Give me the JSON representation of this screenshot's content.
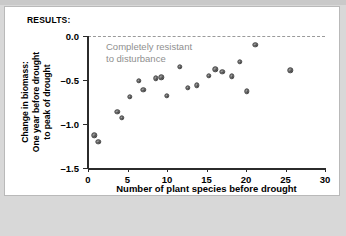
{
  "panel": {
    "header": "RESULTS:"
  },
  "chart_data": {
    "type": "scatter",
    "title": "",
    "xlabel": "Number of plant species before drought",
    "ylabel_lines": [
      "Change in biomass:",
      "One year before drought",
      "to peak of drought"
    ],
    "xlim": [
      0,
      30
    ],
    "ylim": [
      -1.5,
      0.0
    ],
    "xticks": [
      0,
      5,
      10,
      15,
      20,
      25,
      30
    ],
    "xticklabels": [
      "0",
      "5",
      "10",
      "15",
      "20",
      "25",
      "30"
    ],
    "yticks": [
      0.0,
      -0.5,
      -1.0,
      -1.5
    ],
    "yticklabels": [
      "0.0",
      "-0.5",
      "-1.0",
      "-1.5"
    ],
    "grid": false,
    "legend": "none",
    "annotations": [
      {
        "name": "completely-resistant-note",
        "text_lines": [
          "Completely resistant",
          "to disturbance"
        ],
        "color": "#8f8f8f"
      }
    ],
    "reference_line": {
      "name": "zero-reference-line",
      "y": 0.0,
      "style": "dashed",
      "color": "#9a9a9a"
    },
    "marker": {
      "color": "#6e6e6e",
      "edge_color": "#4a4a4a",
      "size_px": 5.4
    },
    "points": [
      {
        "x": 0.8,
        "y": -1.13
      },
      {
        "x": 1.3,
        "y": -1.2
      },
      {
        "x": 3.7,
        "y": -0.86
      },
      {
        "x": 4.3,
        "y": -0.93
      },
      {
        "x": 5.3,
        "y": -0.69
      },
      {
        "x": 6.4,
        "y": -0.51
      },
      {
        "x": 7.0,
        "y": -0.61
      },
      {
        "x": 8.6,
        "y": -0.48
      },
      {
        "x": 9.3,
        "y": -0.47
      },
      {
        "x": 10.0,
        "y": -0.68
      },
      {
        "x": 11.6,
        "y": -0.35
      },
      {
        "x": 12.6,
        "y": -0.59
      },
      {
        "x": 13.8,
        "y": -0.56
      },
      {
        "x": 15.3,
        "y": -0.45
      },
      {
        "x": 16.1,
        "y": -0.38
      },
      {
        "x": 17.0,
        "y": -0.41
      },
      {
        "x": 18.2,
        "y": -0.46
      },
      {
        "x": 19.2,
        "y": -0.29
      },
      {
        "x": 20.1,
        "y": -0.63
      },
      {
        "x": 21.2,
        "y": -0.1
      },
      {
        "x": 25.6,
        "y": -0.39
      }
    ]
  }
}
